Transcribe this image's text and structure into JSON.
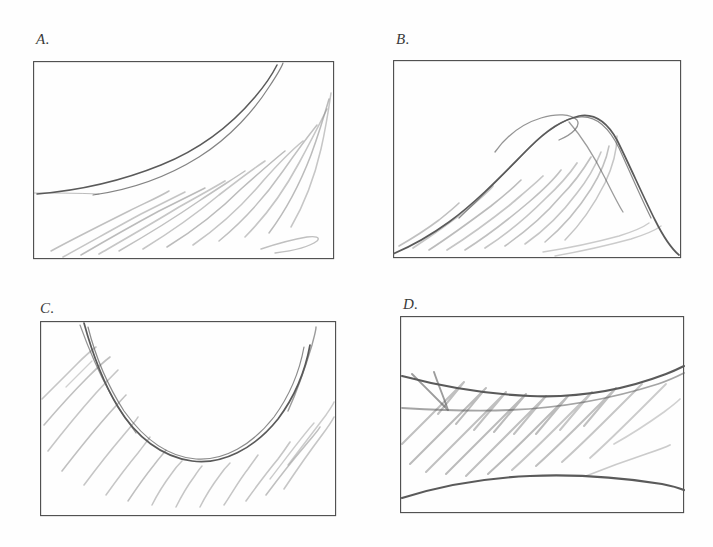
{
  "document": {
    "kind": "hand-drawn-pencil-sketch-sheet",
    "background_color": "#fefefe",
    "ink_color": "#5a5a5a",
    "frame_color": "#4a4a4a",
    "hatch_color": "#8d8d8d",
    "panel_count": 4
  },
  "panels": [
    {
      "id": "panel-a",
      "label": "A.",
      "label_x": 36,
      "label_y": 31,
      "box": {
        "x": 33,
        "y": 61,
        "w": 300,
        "h": 197
      },
      "description": "Rising concave-up curve from lower-left to upper-right with pencil hatching filling the region beneath it",
      "curve_type": "increasing-convex",
      "shading_region": "below-curve",
      "hatch_direction": "down-left-to-up-right",
      "hatch_stroke_count": 13
    },
    {
      "id": "panel-b",
      "label": "B.",
      "label_x": 396,
      "label_y": 31,
      "box": {
        "x": 393,
        "y": 60,
        "w": 287,
        "h": 197
      },
      "description": "Single-peak hill curve rising from the left edge to a rounded summit then falling to the right edge, with hatching filling the area under the hill",
      "curve_type": "unimodal-peak",
      "shading_region": "below-curve",
      "hatch_direction": "down-left-to-up-right",
      "hatch_stroke_count": 12
    },
    {
      "id": "panel-c",
      "label": "C.",
      "label_x": 40,
      "label_y": 300,
      "box": {
        "x": 40,
        "y": 321,
        "w": 295,
        "h": 194
      },
      "description": "U-shaped valley curve descending from the top-left, bottoming in the middle and rising to the top-right, with hatching filling the region below the curve",
      "curve_type": "u-shaped-minimum",
      "shading_region": "below-curve",
      "hatch_direction": "down-left-to-up-right",
      "hatch_stroke_count": 14
    },
    {
      "id": "panel-d",
      "label": "D.",
      "label_x": 403,
      "label_y": 296,
      "box": {
        "x": 400,
        "y": 316,
        "w": 283,
        "h": 196
      },
      "description": "Two gently bowed curves, an upper arc bulging downward and a lower arc bulging upward, enclosing a lens-shaped band that is hatched",
      "curve_type": "two-bounding-arcs-band",
      "shading_region": "between-curves",
      "hatch_direction": "down-left-to-up-right",
      "hatch_stroke_count": 11
    }
  ]
}
